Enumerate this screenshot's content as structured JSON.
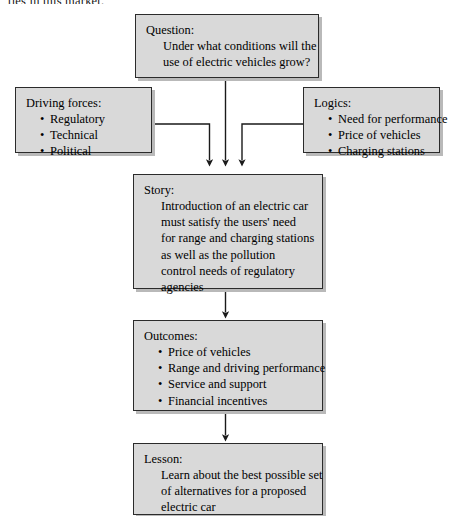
{
  "page": {
    "clipped_text_above": "ties in this market."
  },
  "diagram": {
    "type": "flowchart",
    "nodes": {
      "question": {
        "heading": "Question:",
        "lines": [
          "Under what conditions will the",
          "use of electric vehicles grow?"
        ]
      },
      "driving_forces": {
        "heading": "Driving forces:",
        "bullets": [
          "Regulatory",
          "Technical",
          "Political"
        ]
      },
      "logics": {
        "heading": "Logics:",
        "bullets": [
          "Need for performance",
          "Price of vehicles",
          "Charging stations"
        ]
      },
      "story": {
        "heading": "Story:",
        "lines": [
          "Introduction of an electric car",
          "must satisfy the users' need",
          "for range and charging stations",
          "as well as the pollution",
          "control needs of regulatory",
          "agencies"
        ]
      },
      "outcomes": {
        "heading": "Outcomes:",
        "bullets": [
          "Price of vehicles",
          "Range and driving performance",
          "Service and support",
          "Financial incentives"
        ]
      },
      "lesson": {
        "heading": "Lesson:",
        "lines": [
          "Learn about the best possible set",
          "of alternatives for a proposed",
          "electric car"
        ]
      }
    },
    "edges": [
      {
        "from": "question",
        "to": "story"
      },
      {
        "from": "driving_forces",
        "to": "story"
      },
      {
        "from": "logics",
        "to": "story"
      },
      {
        "from": "story",
        "to": "outcomes"
      },
      {
        "from": "outcomes",
        "to": "lesson"
      }
    ],
    "colors": {
      "node_fill": "#d9d9d9",
      "node_border": "#2b2b2b",
      "node_shadow": "#b9b9b9",
      "connector": "#1a1a1a",
      "background": "#ffffff"
    }
  }
}
